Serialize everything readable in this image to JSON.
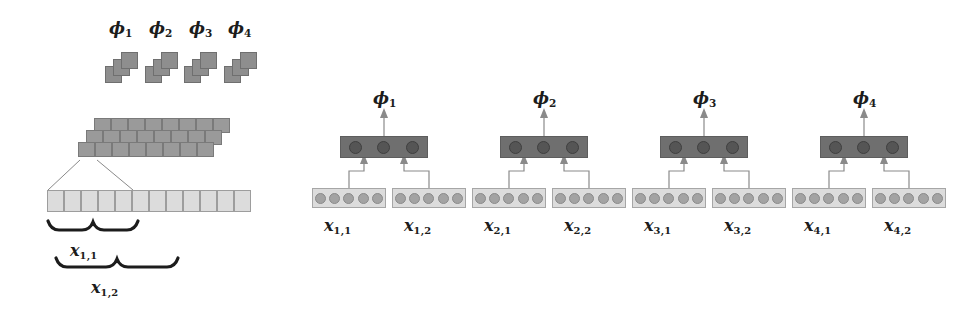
{
  "figure": {
    "kind": "neural-network-architecture-diagram",
    "panels": [
      "left-hierarchical-feature-extraction",
      "right-unrolled-network"
    ]
  },
  "left_panel": {
    "phi_labels": [
      "ϕ1",
      "ϕ2",
      "ϕ3",
      "ϕ4"
    ],
    "phi_label_parts": [
      {
        "base": "ϕ",
        "sub": "1"
      },
      {
        "base": "ϕ",
        "sub": "2"
      },
      {
        "base": "ϕ",
        "sub": "3"
      },
      {
        "base": "ϕ",
        "sub": "4"
      }
    ],
    "phi_stack_depth": 3,
    "feature_bar": {
      "rows": 3,
      "cells_per_row": 8
    },
    "input_strip": {
      "cells": 12
    },
    "braces": [
      {
        "label_base": "x",
        "label_sub": "1,1",
        "spans_cells": 5
      },
      {
        "label_base": "x",
        "label_sub": "1,2",
        "spans_cells": 7
      }
    ]
  },
  "right_panel": {
    "modules": [
      {
        "output": {
          "base": "ϕ",
          "sub": "1"
        },
        "hidden_units": 3,
        "inputs": [
          {
            "base": "x",
            "sub": "1,1",
            "units": 5
          },
          {
            "base": "x",
            "sub": "1,2",
            "units": 5
          }
        ]
      },
      {
        "output": {
          "base": "ϕ",
          "sub": "2"
        },
        "hidden_units": 3,
        "inputs": [
          {
            "base": "x",
            "sub": "2,1",
            "units": 5
          },
          {
            "base": "x",
            "sub": "2,2",
            "units": 5
          }
        ]
      },
      {
        "output": {
          "base": "ϕ",
          "sub": "3"
        },
        "hidden_units": 3,
        "inputs": [
          {
            "base": "x",
            "sub": "3,1",
            "units": 5
          },
          {
            "base": "x",
            "sub": "3,2",
            "units": 5
          }
        ]
      },
      {
        "output": {
          "base": "ϕ",
          "sub": "4"
        },
        "hidden_units": 3,
        "inputs": [
          {
            "base": "x",
            "sub": "4,1",
            "units": 5
          },
          {
            "base": "x",
            "sub": "4,2",
            "units": 5
          }
        ]
      }
    ]
  },
  "colors": {
    "phi_block": "#8e8e8e",
    "feature_cell": "#9a9a9a",
    "input_cell": "#dcdcdc",
    "hidden_layer_box": "#6f6f6f",
    "hidden_unit": "#555555",
    "input_unit": "#a3a3a3",
    "line": "#8a8a8a",
    "text": "#1c1c1c"
  }
}
